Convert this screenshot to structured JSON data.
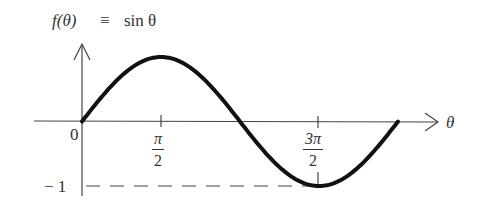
{
  "chart_data": {
    "type": "line",
    "xlabel": "θ",
    "ylabel": "f(θ)",
    "x_ticks": [
      "0",
      "π/2",
      "3π/2"
    ],
    "y_ticks": [
      "−1"
    ],
    "x": [
      0,
      0.7854,
      1.5708,
      2.3562,
      3.1416,
      3.927,
      4.7124,
      5.4978,
      6.2832
    ],
    "values": [
      0,
      0.7071,
      1,
      0.7071,
      0,
      -0.7071,
      -1,
      -0.7071,
      0
    ],
    "xlim": [
      0,
      6.2832
    ],
    "ylim": [
      -1,
      1
    ],
    "grid": false,
    "annotations": [
      "dashed line at y = −1 from axis to 3π/2"
    ]
  },
  "labels": {
    "title_func": "f(θ)",
    "title_equiv": "≡",
    "title_sin": "sin θ",
    "origin": "0",
    "theta": "θ",
    "pi_num": "π",
    "pi_den": "2",
    "three_pi_num": "3π",
    "three_pi_den": "2",
    "minus_one": "− 1"
  },
  "colors": {
    "curve": "#111111",
    "axis": "#444444",
    "text": "#333333"
  }
}
